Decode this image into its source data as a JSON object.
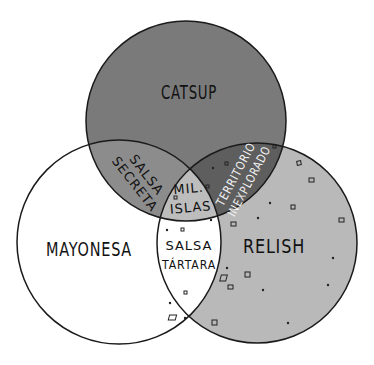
{
  "diagram": {
    "type": "venn-3",
    "sets": [
      {
        "id": "catsup",
        "label": "CATSUP",
        "color": "#7a7a7a"
      },
      {
        "id": "mayonesa",
        "label": "MAYONESA",
        "color": "#ffffff"
      },
      {
        "id": "relish",
        "label": "RELISH",
        "color": "#b9b9b9"
      }
    ],
    "intersections": [
      {
        "sets": [
          "catsup",
          "mayonesa"
        ],
        "label_lines": [
          "SALSA",
          "SECRETA"
        ],
        "color": "#8c8c8c"
      },
      {
        "sets": [
          "catsup",
          "relish"
        ],
        "label_lines": [
          "TERRITORIO",
          "INEXPLORADO"
        ],
        "color": "#5e5e5e"
      },
      {
        "sets": [
          "mayonesa",
          "relish"
        ],
        "label_lines": [
          "SALSA",
          "TÁRTARA"
        ],
        "color": "#ffffff"
      },
      {
        "sets": [
          "catsup",
          "mayonesa",
          "relish"
        ],
        "label_lines": [
          "MIL.",
          "ISLAS"
        ],
        "color": "#bdbdbd"
      }
    ],
    "outline_color": "#1a1a1a"
  }
}
